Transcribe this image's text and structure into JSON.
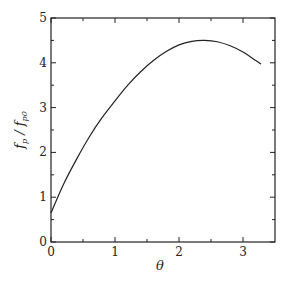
{
  "chart_data": {
    "type": "line",
    "title": "",
    "xlabel": "θ",
    "ylabel": "f_p / f_p0",
    "xlim": [
      0,
      3.5
    ],
    "ylim": [
      0,
      5
    ],
    "x_ticks": [
      0,
      1,
      2,
      3
    ],
    "x_minor_ticks": [
      0.5,
      1.5,
      2.5
    ],
    "y_ticks": [
      0,
      1,
      2,
      3,
      4,
      5
    ],
    "y_minor_ticks": [
      0.5,
      1.5,
      2.5,
      3.5,
      4.5
    ],
    "grid": false,
    "legend": null,
    "series": [
      {
        "name": "f_p / f_p0",
        "x": [
          0,
          0.2,
          0.4,
          0.6,
          0.8,
          1.0,
          1.2,
          1.4,
          1.6,
          1.8,
          2.0,
          2.2,
          2.4,
          2.6,
          2.8,
          3.0,
          3.2,
          3.28
        ],
        "y": [
          0.65,
          1.3,
          1.85,
          2.35,
          2.78,
          3.15,
          3.5,
          3.8,
          4.05,
          4.25,
          4.4,
          4.48,
          4.5,
          4.47,
          4.38,
          4.24,
          4.05,
          3.97
        ]
      }
    ]
  }
}
